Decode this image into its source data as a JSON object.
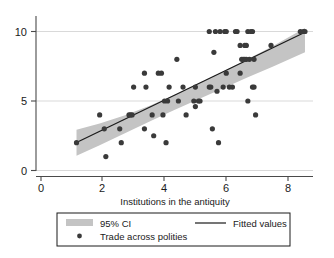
{
  "chart_data": {
    "type": "scatter",
    "title": "",
    "subtitle": "",
    "xlabel": "Institutions in the antiquity",
    "ylabel": "",
    "xlim": [
      -0.3,
      9.1
    ],
    "ylim": [
      -0.6,
      11.0
    ],
    "xticks": [
      0,
      2,
      4,
      6,
      8
    ],
    "xticklabels": [
      "0",
      "2",
      "4",
      "6",
      "8"
    ],
    "yticks": [
      0,
      5,
      10
    ],
    "yticklabels": [
      "0",
      "5",
      "10"
    ],
    "grid": "horizontal",
    "grid_color": "#d9d9d9",
    "marker_color": "#3a3a3a",
    "marker_size": 2.6,
    "line_color": "#1a1a1a",
    "ci_color": "#c4c4c4",
    "legend_position": "below",
    "legend": [
      {
        "label": "95% CI",
        "kind": "band"
      },
      {
        "label": "Fitted values",
        "kind": "line"
      },
      {
        "label": "Trade across polities",
        "kind": "marker"
      }
    ],
    "fit": {
      "x_start": 1.15,
      "x_end": 8.55,
      "y_start": 2.02,
      "y_end": 9.95
    },
    "ci_band": {
      "x": [
        1.15,
        1.9,
        2.7,
        3.5,
        4.3,
        5.1,
        5.9,
        6.7,
        7.5,
        8.55
      ],
      "upper": [
        2.93,
        3.38,
        3.95,
        4.64,
        5.42,
        6.26,
        7.13,
        8.02,
        8.94,
        10.25
      ],
      "lower": [
        1.06,
        1.82,
        2.66,
        3.5,
        4.33,
        5.13,
        5.92,
        6.7,
        7.46,
        8.5
      ]
    },
    "points": [
      [
        1.15,
        2.0
      ],
      [
        1.9,
        4.0
      ],
      [
        2.05,
        3.0
      ],
      [
        2.1,
        1.0
      ],
      [
        2.55,
        3.0
      ],
      [
        2.6,
        2.0
      ],
      [
        2.85,
        4.0
      ],
      [
        2.9,
        4.0
      ],
      [
        2.95,
        4.0
      ],
      [
        3.0,
        6.0
      ],
      [
        3.35,
        7.0
      ],
      [
        3.35,
        3.0
      ],
      [
        3.4,
        6.0
      ],
      [
        3.6,
        4.0
      ],
      [
        3.65,
        2.5
      ],
      [
        3.8,
        7.0
      ],
      [
        3.9,
        7.0
      ],
      [
        3.95,
        4.0
      ],
      [
        4.0,
        5.0
      ],
      [
        4.05,
        2.0
      ],
      [
        4.1,
        5.0
      ],
      [
        4.15,
        6.0
      ],
      [
        4.4,
        8.0
      ],
      [
        4.45,
        5.0
      ],
      [
        4.6,
        6.0
      ],
      [
        4.7,
        4.0
      ],
      [
        4.95,
        5.0
      ],
      [
        5.0,
        6.0
      ],
      [
        5.0,
        4.6
      ],
      [
        5.1,
        5.0
      ],
      [
        5.15,
        5.0
      ],
      [
        5.45,
        10.0
      ],
      [
        5.45,
        6.0
      ],
      [
        5.5,
        6.0
      ],
      [
        5.55,
        3.0
      ],
      [
        5.6,
        8.5
      ],
      [
        5.65,
        10.0
      ],
      [
        5.7,
        5.7
      ],
      [
        5.75,
        2.0
      ],
      [
        5.8,
        10.0
      ],
      [
        5.9,
        6.0
      ],
      [
        5.95,
        10.0
      ],
      [
        6.0,
        7.0
      ],
      [
        6.0,
        10.0
      ],
      [
        6.1,
        6.0
      ],
      [
        6.2,
        6.0
      ],
      [
        6.3,
        10.0
      ],
      [
        6.35,
        10.0
      ],
      [
        6.45,
        7.0
      ],
      [
        6.45,
        9.0
      ],
      [
        6.5,
        8.0
      ],
      [
        6.55,
        8.0
      ],
      [
        6.6,
        8.0
      ],
      [
        6.6,
        9.0
      ],
      [
        6.65,
        8.0
      ],
      [
        6.65,
        9.0
      ],
      [
        6.7,
        10.0
      ],
      [
        6.7,
        5.0
      ],
      [
        6.75,
        8.0
      ],
      [
        6.8,
        10.0
      ],
      [
        6.85,
        10.0
      ],
      [
        6.85,
        6.0
      ],
      [
        6.9,
        8.0
      ],
      [
        6.9,
        6.0
      ],
      [
        6.95,
        4.0
      ],
      [
        7.45,
        9.0
      ],
      [
        8.4,
        10.0
      ],
      [
        8.5,
        10.0
      ],
      [
        8.55,
        10.0
      ]
    ]
  }
}
